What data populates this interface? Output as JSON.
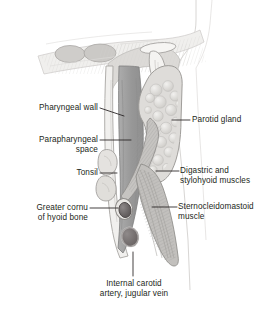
{
  "figure": {
    "type": "anatomical-illustration",
    "background_color": "#ffffff",
    "text_color": "#231f20",
    "leader_color": "#231f20"
  },
  "palette": {
    "parapharyngeal_space": "#9a9a9a",
    "parotid_gland": "#d8d8d6",
    "muscle": "#bdbdbd",
    "bone": "#ebeae8",
    "vessel_artery": "#6e6a6a",
    "vessel_vein": "#7a7474",
    "tonsil": "#dedcd9",
    "outline": "#8d8d8d",
    "faint_outline": "#cfcfcf"
  },
  "labels": [
    {
      "id": "pharyngeal-wall",
      "text": "Pharyngeal wall",
      "lines": [
        "Pharyngeal wall"
      ],
      "side": "left",
      "text_x": 18,
      "text_y": 103,
      "text_width": 80,
      "leader": {
        "x1": 100,
        "y1": 108,
        "x2": 124,
        "y2": 116
      }
    },
    {
      "id": "parapharyngeal-space",
      "text": "Parapharyngeal space",
      "lines": [
        "Parapharyngeal",
        "space"
      ],
      "side": "left",
      "text_x": 10,
      "text_y": 135,
      "text_width": 88,
      "leader": {
        "x1": 100,
        "y1": 140,
        "x2": 131,
        "y2": 140
      }
    },
    {
      "id": "tonsil",
      "text": "Tonsil",
      "lines": [
        "Tonsil"
      ],
      "side": "left",
      "text_x": 52,
      "text_y": 168,
      "text_width": 46,
      "leader": {
        "x1": 100,
        "y1": 173,
        "x2": 117,
        "y2": 173
      }
    },
    {
      "id": "greater-cornu-of-hyoid-bone",
      "text": "Greater cornu of hyoid bone",
      "lines": [
        "Greater cornu",
        "of hyoid bone"
      ],
      "side": "left",
      "text_x": 10,
      "text_y": 203,
      "text_width": 78,
      "leader": {
        "x1": 90,
        "y1": 208,
        "x2": 118,
        "y2": 208
      }
    },
    {
      "id": "parotid-gland",
      "text": "Parotid gland",
      "lines": [
        "Parotid gland"
      ],
      "side": "right",
      "text_x": 192,
      "text_y": 115,
      "text_width": 76,
      "leader": {
        "x1": 172,
        "y1": 120,
        "x2": 190,
        "y2": 120
      }
    },
    {
      "id": "digastric-and-stylohyoid-muscles",
      "text": "Digastric and stylohyoid muscles",
      "lines": [
        "Digastric and",
        "stylohyoid muscles"
      ],
      "side": "right",
      "text_x": 180,
      "text_y": 166,
      "text_width": 90,
      "leader": {
        "x1": 156,
        "y1": 171,
        "x2": 179,
        "y2": 171
      }
    },
    {
      "id": "sternocleidomastoid-muscle",
      "text": "Sternocleidomastoid muscle",
      "lines": [
        "Sternocleidomastoid",
        "muscle"
      ],
      "side": "right",
      "text_x": 178,
      "text_y": 202,
      "text_width": 94,
      "leader": {
        "x1": 152,
        "y1": 207,
        "x2": 177,
        "y2": 207
      }
    },
    {
      "id": "internal-carotid-artery-jugular-vein",
      "text": "Internal carotid artery, jugular vein",
      "lines": [
        "Internal carotid",
        "artery, jugular vein"
      ],
      "side": "center",
      "text_x": 72,
      "text_y": 279,
      "text_width": 124,
      "leader": {
        "x1": 133,
        "y1": 252,
        "x2": 133,
        "y2": 276
      }
    }
  ]
}
